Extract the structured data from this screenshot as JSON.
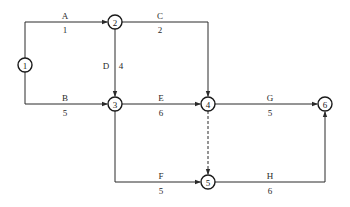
{
  "diagram": {
    "type": "activity-on-arrow network",
    "nodes": [
      {
        "id": "1",
        "label": "1",
        "x": 25,
        "y": 65
      },
      {
        "id": "2",
        "label": "2",
        "x": 115,
        "y": 22
      },
      {
        "id": "3",
        "label": "3",
        "x": 115,
        "y": 104
      },
      {
        "id": "4",
        "label": "4",
        "x": 208,
        "y": 104
      },
      {
        "id": "5",
        "label": "5",
        "x": 208,
        "y": 182
      },
      {
        "id": "6",
        "label": "6",
        "x": 325,
        "y": 104
      }
    ],
    "activities": [
      {
        "name": "A",
        "duration": "1",
        "from": "1",
        "to": "2"
      },
      {
        "name": "B",
        "duration": "5",
        "from": "1",
        "to": "3"
      },
      {
        "name": "C",
        "duration": "2",
        "from": "2",
        "to": "4"
      },
      {
        "name": "D",
        "duration": "4",
        "from": "2",
        "to": "3"
      },
      {
        "name": "E",
        "duration": "6",
        "from": "3",
        "to": "4"
      },
      {
        "name": "F",
        "duration": "5",
        "from": "3",
        "to": "5"
      },
      {
        "name": "G",
        "duration": "5",
        "from": "4",
        "to": "6"
      },
      {
        "name": "H",
        "duration": "6",
        "from": "5",
        "to": "6"
      }
    ],
    "dummy_activities": [
      {
        "from": "4",
        "to": "5",
        "style": "dashed"
      }
    ],
    "colors": {
      "line": "#2a2a2a",
      "node_border": "#1a1a1a",
      "background": "#ffffff"
    }
  }
}
